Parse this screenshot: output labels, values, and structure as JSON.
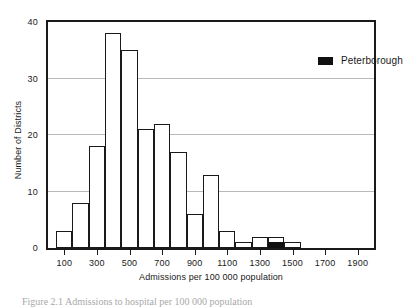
{
  "chart_data": {
    "type": "bar",
    "title": "",
    "xlabel": "Admissions per 100 000 population",
    "ylabel": "Number of Districts",
    "categories": [
      100,
      200,
      300,
      400,
      500,
      600,
      700,
      800,
      900,
      1000,
      1100,
      1200,
      1300,
      1400,
      1500
    ],
    "values": [
      3,
      8,
      18,
      38,
      35,
      21,
      22,
      17,
      6,
      13,
      3,
      1,
      2,
      2,
      1
    ],
    "highlight": {
      "category": 1400,
      "value": 1,
      "label": "Peterborough",
      "color": "#111111"
    },
    "xlim": [
      0,
      2000
    ],
    "ylim": [
      0,
      40
    ],
    "x_tick_labels": [
      "100",
      "300",
      "500",
      "700",
      "900",
      "1100",
      "1300",
      "1500",
      "1700",
      "1900"
    ],
    "x_tick_values": [
      100,
      300,
      500,
      700,
      900,
      1100,
      1300,
      1500,
      1700,
      1900
    ],
    "y_tick_labels": [
      "0",
      "10",
      "20",
      "30",
      "40"
    ],
    "y_tick_values": [
      0,
      10,
      20,
      30,
      40
    ],
    "y_minor_ticks": [
      5,
      15,
      25,
      35
    ],
    "grid": "horizontal",
    "grid_values": [
      10,
      20,
      30
    ],
    "bar_fill": "#ffffff",
    "bar_stroke": "#1a1a1a"
  },
  "legend": {
    "position": "top-right",
    "entries": [
      {
        "label": "Peterborough",
        "color": "#111111",
        "marker": "filled-square"
      }
    ]
  },
  "axes": {
    "y_title": "Number of Districts",
    "x_title": "Admissions per 100 000 population"
  },
  "caption": {
    "text": "Figure 2.1   Admissions to hospital per 100 000 population"
  }
}
